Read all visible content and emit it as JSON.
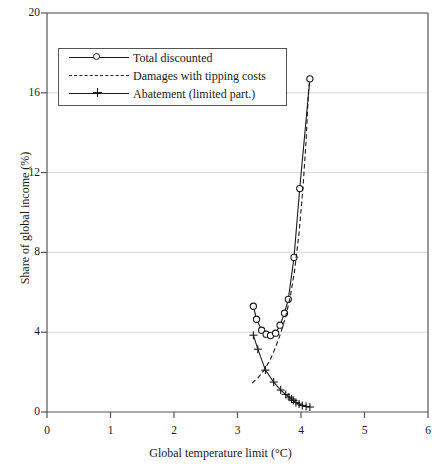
{
  "chart_data": {
    "type": "line",
    "title": "",
    "xlabel": "Global temperature limit (°C)",
    "ylabel": "Share of global income (%)",
    "xlim": [
      0,
      6
    ],
    "ylim": [
      0,
      20
    ],
    "xticks": [
      0,
      1,
      2,
      3,
      4,
      5,
      6
    ],
    "yticks": [
      0,
      4,
      8,
      12,
      16,
      20
    ],
    "xtick_labels": [
      "0",
      "1",
      "2",
      "3",
      "4",
      "5",
      "6"
    ],
    "ytick_labels": [
      "0",
      "4",
      "8",
      "12",
      "16",
      "20"
    ],
    "grid": "horizontal",
    "legend_position": "upper-left",
    "series": [
      {
        "name": "Total discounted",
        "style": "solid",
        "marker": "circle",
        "points": [
          [
            3.25,
            5.3
          ],
          [
            3.3,
            4.65
          ],
          [
            3.38,
            4.1
          ],
          [
            3.45,
            3.9
          ],
          [
            3.52,
            3.83
          ],
          [
            3.6,
            3.95
          ],
          [
            3.67,
            4.35
          ],
          [
            3.74,
            4.95
          ],
          [
            3.8,
            5.65
          ],
          [
            3.89,
            7.75
          ],
          [
            3.98,
            11.2
          ],
          [
            4.14,
            16.7
          ]
        ]
      },
      {
        "name": "Damages with tipping costs",
        "style": "dashed",
        "marker": "none",
        "points": [
          [
            3.23,
            1.45
          ],
          [
            3.32,
            1.7
          ],
          [
            3.42,
            2.1
          ],
          [
            3.52,
            2.65
          ],
          [
            3.6,
            3.25
          ],
          [
            3.68,
            3.95
          ],
          [
            3.76,
            4.8
          ],
          [
            3.83,
            5.75
          ],
          [
            3.9,
            7.1
          ],
          [
            3.97,
            9.0
          ],
          [
            4.03,
            11.2
          ],
          [
            4.08,
            13.6
          ],
          [
            4.12,
            16.2
          ],
          [
            4.14,
            16.7
          ]
        ]
      },
      {
        "name": "Abatement (limited part.)",
        "style": "solid",
        "marker": "plus",
        "points": [
          [
            3.25,
            3.85
          ],
          [
            3.32,
            3.15
          ],
          [
            3.44,
            2.1
          ],
          [
            3.57,
            1.5
          ],
          [
            3.68,
            1.1
          ],
          [
            3.76,
            0.88
          ],
          [
            3.81,
            0.75
          ],
          [
            3.85,
            0.65
          ],
          [
            3.88,
            0.58
          ],
          [
            3.92,
            0.48
          ],
          [
            3.97,
            0.4
          ],
          [
            4.02,
            0.33
          ],
          [
            4.08,
            0.28
          ],
          [
            4.14,
            0.25
          ]
        ]
      }
    ]
  },
  "axes": {
    "x_title": "Global temperature limit (°C)",
    "y_title": "Share of global income (%)"
  },
  "legend": {
    "entries": [
      {
        "label": "Total discounted",
        "marker": "circle-marker-icon",
        "line": "solid-line-icon"
      },
      {
        "label": "Damages with tipping costs",
        "marker": "none",
        "line": "dashed-line-icon"
      },
      {
        "label": "Abatement (limited part.)",
        "marker": "plus-marker-icon",
        "line": "solid-line-icon"
      }
    ]
  },
  "colors": {
    "ink": "#1a1a1a",
    "axis": "#555555",
    "grid": "#d8d8d8",
    "background": "#ffffff"
  }
}
